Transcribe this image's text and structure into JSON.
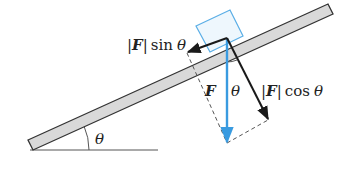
{
  "diagram": {
    "angle_symbol": "θ",
    "labels": {
      "sin_component": {
        "bar_left": "|",
        "vec": "F",
        "bar_right": "|",
        "func": "sin",
        "angle": "θ"
      },
      "cos_component": {
        "bar_left": "|",
        "vec": "F",
        "bar_right": "|",
        "func": "cos",
        "angle": "θ"
      },
      "force": "F",
      "force_angle": "θ",
      "incline_angle": "θ"
    },
    "colors": {
      "ramp_fill": "#d9d9d9",
      "ramp_stroke": "#333333",
      "box_stroke": "#5aaee6",
      "box_fill": "#eef7fd",
      "force_vector": "#3a9be0",
      "component_vectors": "#1a1a1a",
      "dashed": "#555555"
    }
  }
}
